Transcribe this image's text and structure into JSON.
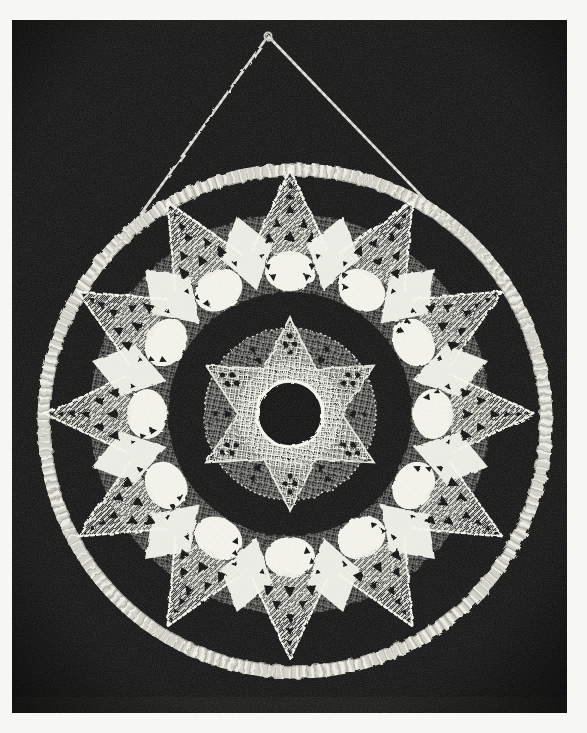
{
  "image": {
    "kind": "black-and-white photograph",
    "subject": "Crocheted twelve-point lace star doily laced inside a thread-wrapped hoop, hung from a cord",
    "alt": "White crochet lace star with a six-point mesh medallion and open center, mounted in a cord-wrapped ring hanging from a triangular cord against a black background"
  },
  "palette": {
    "page_bg": "#f7f7f4",
    "photo_bg": "#111111",
    "lace": "#e7e7e0",
    "lace_bright": "#f5f5ee",
    "ring": "#cfcfc6",
    "ring_hi": "#f1f1ea",
    "ring_shadow": "#7e7e76",
    "cord": "#c8c8c0",
    "hole": "#0b0b0b"
  },
  "geometry": {
    "photo": {
      "x": 12,
      "y": 20,
      "width": 555,
      "height": 693
    },
    "hoop": {
      "cx": 295,
      "cy": 421,
      "radius": 251,
      "band_width": 13
    },
    "cord": {
      "apex_x": 268,
      "apex_y": 36,
      "left_end_x": 93,
      "left_end_y": 281,
      "right_end_x": 505,
      "right_end_y": 283
    },
    "star": {
      "cx": 290,
      "cy": 414,
      "points": 12,
      "tip_radius": 245,
      "base_radius": 168,
      "half_angle_deg": 13
    },
    "band": {
      "mesh_inner": 122,
      "mesh_outer": 200,
      "shell_radius": 143,
      "shell_rx": 25,
      "shell_ry": 20,
      "diamond_inner": 128,
      "diamond_side": 170,
      "diamond_outer": 205
    },
    "medallion": {
      "points": 6,
      "tip_radius": 97,
      "valley_radius": 52,
      "mesh_radius": 86,
      "stitch_ring_radius": 41,
      "hole_radius": 33
    }
  }
}
